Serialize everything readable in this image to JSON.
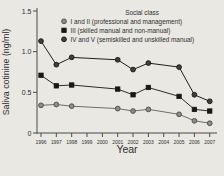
{
  "figure": {
    "background": "#e9e8e3",
    "axis_color": "#4a4a4a",
    "text_color": "#2e2e2e"
  },
  "chart_data": {
    "type": "line",
    "title": "",
    "xlabel": "Year",
    "ylabel": "Saliva cotinine (ng/ml)",
    "ylim": [
      0,
      1.5
    ],
    "yticks": [
      0,
      0.5,
      1.0,
      1.5
    ],
    "ytick_labels": [
      "0",
      "0.5",
      "1.0",
      "1.5"
    ],
    "xticks": [
      1996,
      1997,
      1998,
      1999,
      2000,
      2001,
      2002,
      2003,
      2004,
      2005,
      2006,
      2007
    ],
    "grid": false,
    "legend": {
      "title": "Social class",
      "position": "top-inside"
    },
    "series": [
      {
        "name": "I and II (professional and management)",
        "marker": "circle",
        "marker_fill": "#8c8c8c",
        "marker_stroke": "#4a4a4a",
        "line_color": "#6e6e6e",
        "points": [
          [
            1996,
            0.34
          ],
          [
            1997,
            0.35
          ],
          [
            1998,
            0.33
          ],
          [
            2001,
            0.3
          ],
          [
            2002,
            0.27
          ],
          [
            2003,
            0.29
          ],
          [
            2005,
            0.23
          ],
          [
            2006,
            0.15
          ],
          [
            2007,
            0.12
          ]
        ]
      },
      {
        "name": "III (skilled manual and non-manual)",
        "marker": "square",
        "marker_fill": "#171717",
        "marker_stroke": "#171717",
        "line_color": "#2b2b2b",
        "points": [
          [
            1996,
            0.71
          ],
          [
            1997,
            0.58
          ],
          [
            1998,
            0.59
          ],
          [
            2001,
            0.54
          ],
          [
            2002,
            0.47
          ],
          [
            2003,
            0.56
          ],
          [
            2005,
            0.45
          ],
          [
            2006,
            0.29
          ],
          [
            2007,
            0.27
          ]
        ]
      },
      {
        "name": "IV and V (semiskilled and unskilled manual)",
        "marker": "circle",
        "marker_fill": "#3f3f3f",
        "marker_stroke": "#141414",
        "line_color": "#1e1e1e",
        "points": [
          [
            1996,
            1.13
          ],
          [
            1997,
            0.84
          ],
          [
            1998,
            0.93
          ],
          [
            2001,
            0.9
          ],
          [
            2002,
            0.78
          ],
          [
            2003,
            0.86
          ],
          [
            2005,
            0.81
          ],
          [
            2006,
            0.47
          ],
          [
            2007,
            0.39
          ]
        ]
      }
    ]
  }
}
